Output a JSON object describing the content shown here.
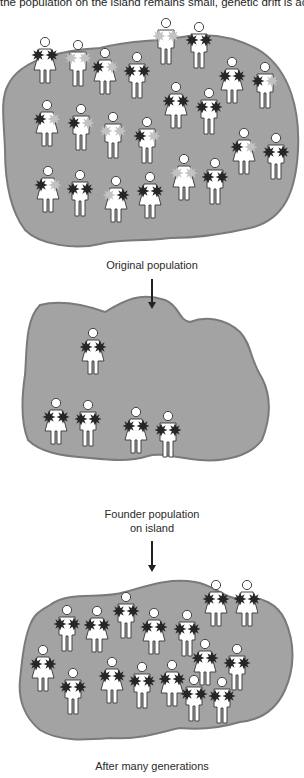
{
  "caption": "the population on the island remains small, genetic drift is accelerated.",
  "stages": [
    {
      "label": "Original population"
    },
    {
      "label_line1": "Founder population",
      "label_line2": "on island"
    },
    {
      "label": "After many generations"
    }
  ],
  "colors": {
    "island_fill": "#a3a3a3",
    "island_edge": "#7a7a7a",
    "allele_dark": "#262626",
    "allele_light": "#c2c2c2",
    "figure_fill": "#ffffff",
    "figure_stroke": "#444444"
  },
  "legend_semantics": {
    "dark_star": "allele-dark",
    "light_star": "allele-light"
  }
}
